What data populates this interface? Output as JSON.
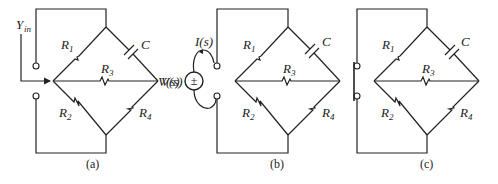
{
  "panels": [
    {
      "id": "a",
      "caption": "(a)",
      "labels": {
        "R1": "R",
        "R1_sub": "1",
        "C": "C",
        "R3": "R",
        "R3_sub": "3",
        "R2": "R",
        "R2_sub": "2",
        "R4": "R",
        "R4_sub": "4",
        "output": "V(s)",
        "input": "Y",
        "input_sub": "in"
      }
    },
    {
      "id": "b",
      "caption": "(b)",
      "labels": {
        "R1": "R",
        "R1_sub": "1",
        "C": "C",
        "R3": "R",
        "R3_sub": "3",
        "R2": "R",
        "R2_sub": "2",
        "R4": "R",
        "R4_sub": "4",
        "source": "V(s)",
        "current": "I(s)",
        "source_sign": "±"
      }
    },
    {
      "id": "c",
      "caption": "(c)",
      "labels": {
        "R1": "R",
        "R1_sub": "1",
        "C": "C",
        "R3": "R",
        "R3_sub": "3",
        "R2": "R",
        "R2_sub": "2",
        "R4": "R",
        "R4_sub": "4"
      }
    }
  ],
  "colors": {
    "ink": "#222222",
    "background": "#ffffff"
  }
}
